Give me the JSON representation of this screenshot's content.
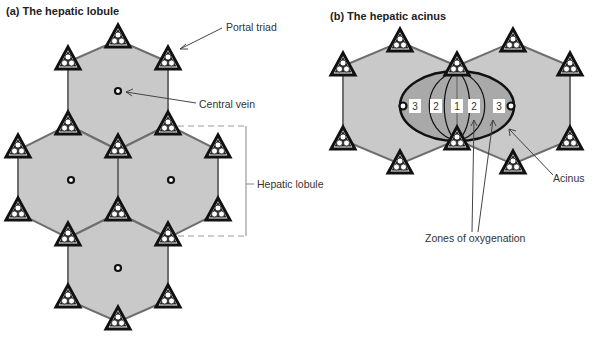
{
  "panel_a": {
    "title": "(a) The hepatic lobule",
    "labels": {
      "portal_triad": "Portal triad",
      "central_vein": "Central vein",
      "hepatic_lobule": "Hepatic lobule"
    }
  },
  "panel_b": {
    "title": "(b) The hepatic acinus",
    "zones": [
      "3",
      "2",
      "1",
      "2",
      "3"
    ],
    "labels": {
      "acinus": "Acinus",
      "zones_of_oxygenation": "Zones of oxygenation"
    }
  },
  "colors": {
    "lobule_fill": "#c9c9c9",
    "acinus_fill": "#a9a9a9",
    "outline": "#111111",
    "hex_edge": "#6e6e6e"
  }
}
